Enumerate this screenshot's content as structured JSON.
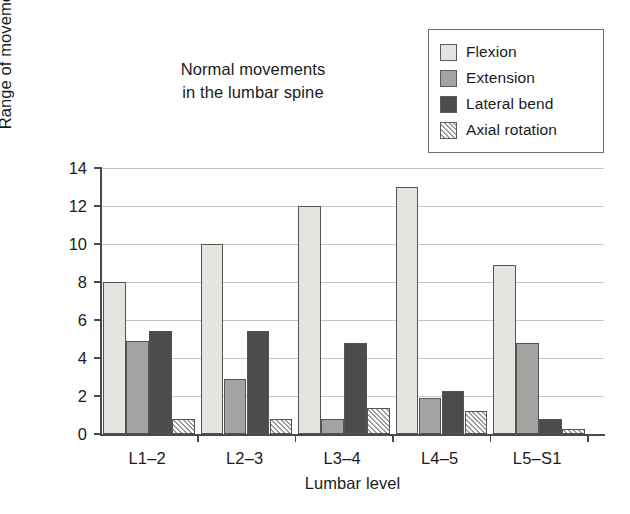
{
  "chart_data": {
    "type": "bar",
    "title": "Normal movements\nin the lumbar spine",
    "xlabel": "Lumbar level",
    "ylabel": "Range of movement (degrees)",
    "categories": [
      "L1–2",
      "L2–3",
      "L3–4",
      "L4–5",
      "L5–S1"
    ],
    "series": [
      {
        "name": "Flexion",
        "values": [
          8.0,
          10.0,
          12.0,
          13.0,
          8.9
        ],
        "color": "#e4e4e1",
        "pattern": "solid"
      },
      {
        "name": "Extension",
        "values": [
          4.9,
          2.9,
          0.8,
          1.9,
          4.8
        ],
        "color": "#a3a3a2",
        "pattern": "solid"
      },
      {
        "name": "Lateral bend",
        "values": [
          5.4,
          5.4,
          4.8,
          2.25,
          0.8
        ],
        "color": "#4c4c4c",
        "pattern": "solid"
      },
      {
        "name": "Axial rotation",
        "values": [
          0.8,
          0.8,
          1.35,
          1.2,
          0.25
        ],
        "color": "#d9d9d6",
        "pattern": "diagonal-hatch"
      }
    ],
    "ylim": [
      0,
      14
    ],
    "yticks": [
      0,
      2,
      4,
      6,
      8,
      10,
      12,
      14
    ],
    "ytick_labels": [
      "0",
      "2",
      "4",
      "6",
      "8",
      "10",
      "12",
      "14"
    ],
    "grid": "horizontal",
    "legend_position": "top-right"
  },
  "legend": {
    "items": [
      {
        "label": "Flexion",
        "swatch": "legend-swatch-flexion"
      },
      {
        "label": "Extension",
        "swatch": "legend-swatch-extension"
      },
      {
        "label": "Lateral bend",
        "swatch": "legend-swatch-lateral-bend"
      },
      {
        "label": "Axial rotation",
        "swatch": "legend-swatch-axial-rotation"
      }
    ]
  }
}
